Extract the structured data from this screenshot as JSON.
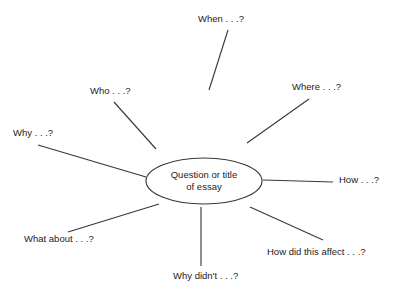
{
  "diagram": {
    "type": "spider-mind-map",
    "title_visible": false,
    "background_color": "#ffffff",
    "line_color": "#3a3a3a",
    "text_color": "#1c1c1c",
    "center": {
      "label_line1": "Question or title",
      "label_line2": "of essay",
      "shape": "ellipse",
      "cx": 204,
      "cy": 181,
      "rx": 58,
      "ry": 23
    },
    "branches": [
      {
        "id": "when",
        "label": "When . . .?",
        "label_x": 198,
        "label_y": 14,
        "line": {
          "x1": 228,
          "y1": 30,
          "x2": 209,
          "y2": 90
        }
      },
      {
        "id": "where",
        "label": "Where . . .?",
        "label_x": 292,
        "label_y": 82,
        "line": {
          "x1": 309,
          "y1": 99,
          "x2": 247,
          "y2": 143
        }
      },
      {
        "id": "who",
        "label": "Who . . .?",
        "label_x": 90,
        "label_y": 86,
        "line": {
          "x1": 114,
          "y1": 102,
          "x2": 156,
          "y2": 149
        }
      },
      {
        "id": "why",
        "label": "Why . . .?",
        "label_x": 13,
        "label_y": 128,
        "line": {
          "x1": 38,
          "y1": 145,
          "x2": 146,
          "y2": 177
        }
      },
      {
        "id": "how",
        "label": "How . . .?",
        "label_x": 339,
        "label_y": 175,
        "line": {
          "x1": 263,
          "y1": 180,
          "x2": 333,
          "y2": 182
        }
      },
      {
        "id": "what-about",
        "label": "What about . . .?",
        "label_x": 24,
        "label_y": 234,
        "line": {
          "x1": 68,
          "y1": 232,
          "x2": 159,
          "y2": 204
        }
      },
      {
        "id": "why-didnt",
        "label": "Why didn't . . .?",
        "label_x": 173,
        "label_y": 271,
        "line": {
          "x1": 201,
          "y1": 207,
          "x2": 201,
          "y2": 266
        }
      },
      {
        "id": "how-did-this-affect",
        "label": "How did this affect . . .?",
        "label_x": 267,
        "label_y": 247,
        "line": {
          "x1": 250,
          "y1": 207,
          "x2": 323,
          "y2": 240
        }
      }
    ]
  }
}
